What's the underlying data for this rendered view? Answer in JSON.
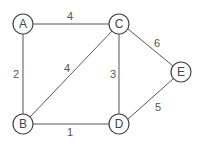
{
  "graph": {
    "nodes": [
      {
        "id": "A",
        "label": "A"
      },
      {
        "id": "B",
        "label": "B"
      },
      {
        "id": "C",
        "label": "C"
      },
      {
        "id": "D",
        "label": "D"
      },
      {
        "id": "E",
        "label": "E"
      }
    ],
    "edges": [
      {
        "from": "A",
        "to": "C",
        "weight": "4"
      },
      {
        "from": "A",
        "to": "B",
        "weight": "2"
      },
      {
        "from": "B",
        "to": "C",
        "weight": "4"
      },
      {
        "from": "C",
        "to": "D",
        "weight": "3"
      },
      {
        "from": "C",
        "to": "E",
        "weight": "6"
      },
      {
        "from": "B",
        "to": "D",
        "weight": "1"
      },
      {
        "from": "D",
        "to": "E",
        "weight": "5"
      }
    ]
  },
  "colors": {
    "stroke": "#444444",
    "text": "#444444",
    "background": "#ffffff"
  }
}
